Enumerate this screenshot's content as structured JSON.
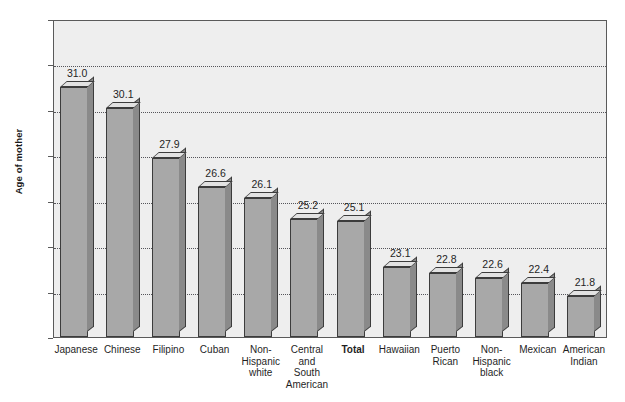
{
  "chart_data": {
    "type": "bar",
    "title": "",
    "xlabel": "",
    "ylabel": "Age of mother",
    "ylim": [
      20,
      34
    ],
    "yticks": [
      20,
      22,
      24,
      26,
      28,
      30,
      32,
      34
    ],
    "ytick_labels": [
      "20",
      "22",
      "24",
      "26",
      "28",
      "30",
      "32",
      "34"
    ],
    "grid": true,
    "legend": null,
    "categories": [
      "Japanese",
      "Chinese",
      "Filipino",
      "Cuban",
      "Non-\nHispanic\nwhite",
      "Central\nand\nSouth\nAmerican",
      "Total",
      "Hawaiian",
      "Puerto\nRican",
      "Non-\nHispanic\nblack",
      "Mexican",
      "American\nIndian"
    ],
    "values": [
      31.0,
      30.1,
      27.9,
      26.6,
      26.1,
      25.2,
      25.1,
      23.1,
      22.8,
      22.6,
      22.4,
      21.8
    ],
    "value_labels": [
      "31.0",
      "30.1",
      "27.9",
      "26.6",
      "26.1",
      "25.2",
      "25.1",
      "23.1",
      "22.8",
      "22.6",
      "22.4",
      "21.8"
    ],
    "emphasized_category": "Total",
    "colors": {
      "bar_front": "#a8a8a8",
      "bar_side": "#8a8a8a",
      "bar_top": "#e2e2e2",
      "bar_outline": "#3c3c3c",
      "plot_background": "#eeeeee",
      "gridline": "#55555a",
      "axis": "#5a5a5a",
      "text": "#1f1f1f",
      "page_background": "#ffffff"
    }
  }
}
